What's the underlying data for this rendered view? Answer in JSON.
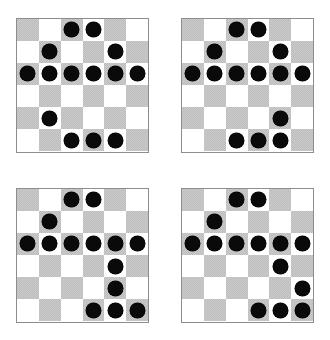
{
  "figure": {
    "board_count": 4,
    "rows": 6,
    "cols": 6,
    "colors": {
      "dark_square": "#cbcbcb",
      "light_square": "#ffffff",
      "piece": "#0a0a0a",
      "border": "#8d8d8d",
      "background": "#ffffff"
    },
    "shading_rule": "square is dark when (row + col) is even, 1-indexed",
    "piece_label": "black-checker-piece"
  },
  "boards": [
    {
      "name": "board-top-left",
      "position": "top-left",
      "piece_count": 14,
      "pieces": [
        [
          1,
          3
        ],
        [
          1,
          4
        ],
        [
          2,
          2
        ],
        [
          2,
          5
        ],
        [
          3,
          1
        ],
        [
          3,
          2
        ],
        [
          3,
          3
        ],
        [
          3,
          4
        ],
        [
          3,
          5
        ],
        [
          3,
          6
        ],
        [
          5,
          2
        ],
        [
          6,
          3
        ],
        [
          6,
          4
        ],
        [
          6,
          5
        ]
      ]
    },
    {
      "name": "board-top-right",
      "position": "top-right",
      "piece_count": 14,
      "pieces": [
        [
          1,
          3
        ],
        [
          1,
          4
        ],
        [
          2,
          2
        ],
        [
          2,
          5
        ],
        [
          3,
          1
        ],
        [
          3,
          2
        ],
        [
          3,
          3
        ],
        [
          3,
          4
        ],
        [
          3,
          5
        ],
        [
          3,
          6
        ],
        [
          5,
          5
        ],
        [
          6,
          3
        ],
        [
          6,
          4
        ],
        [
          6,
          5
        ]
      ]
    },
    {
      "name": "board-bottom-left",
      "position": "bottom-left",
      "piece_count": 14,
      "pieces": [
        [
          1,
          3
        ],
        [
          1,
          4
        ],
        [
          2,
          2
        ],
        [
          3,
          1
        ],
        [
          3,
          2
        ],
        [
          3,
          3
        ],
        [
          3,
          4
        ],
        [
          3,
          5
        ],
        [
          3,
          6
        ],
        [
          4,
          5
        ],
        [
          5,
          5
        ],
        [
          6,
          4
        ],
        [
          6,
          5
        ],
        [
          6,
          6
        ]
      ]
    },
    {
      "name": "board-bottom-right",
      "position": "bottom-right",
      "piece_count": 14,
      "pieces": [
        [
          1,
          3
        ],
        [
          1,
          4
        ],
        [
          2,
          2
        ],
        [
          3,
          1
        ],
        [
          3,
          2
        ],
        [
          3,
          3
        ],
        [
          3,
          4
        ],
        [
          3,
          5
        ],
        [
          3,
          6
        ],
        [
          4,
          5
        ],
        [
          5,
          6
        ],
        [
          6,
          4
        ],
        [
          6,
          5
        ],
        [
          6,
          6
        ]
      ]
    }
  ]
}
